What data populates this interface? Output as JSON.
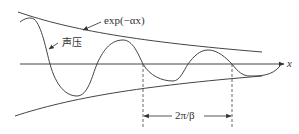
{
  "diagram": {
    "title": "",
    "labels": {
      "envelope": "exp(−αx)",
      "pressure": "声压",
      "axis": "x",
      "wavelength": "2π/β"
    },
    "colors": {
      "line": "#444444",
      "text": "#333333",
      "background": "#ffffff"
    },
    "annotations": [
      {
        "text": "exp(−αx)",
        "points_to": "upper-envelope"
      },
      {
        "text": "声压",
        "points_to": "pressure-wave"
      },
      {
        "text": "2π/β",
        "spans": "one-wavelength-between-dashed-lines"
      }
    ]
  }
}
